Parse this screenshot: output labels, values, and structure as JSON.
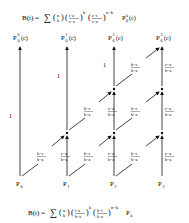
{
  "formulas": {
    "top": "B(t) = Σ ( n k ) ( (t−a)/(c−a) )^k ( (c−t)/(c−a) )^(n−k) P₀^k(c)",
    "bottom": "B(t) = Σ ( n k ) ( (t−a)/(b−a) )^k ( (b−t)/(b−a) )^(n−k) P_k"
  },
  "top_points": [
    {
      "base": "P",
      "sub": "0",
      "sup": "0",
      "arg": "(c)"
    },
    {
      "base": "P",
      "sub": "0",
      "sup": "1",
      "arg": "(c)"
    },
    {
      "base": "P",
      "sub": "0",
      "sup": "2",
      "arg": "(c)"
    },
    {
      "base": "P",
      "sub": "0",
      "sup": "3",
      "arg": "(c)"
    }
  ],
  "control_points": [
    {
      "base": "P",
      "sub": "0"
    },
    {
      "base": "P",
      "sub": "1"
    },
    {
      "base": "P",
      "sub": "2"
    },
    {
      "base": "P",
      "sub": "3"
    }
  ],
  "weights": {
    "one": "1",
    "vertical_num": "c−a",
    "vertical_den": "b−a",
    "diagonal_num": "b−c",
    "diagonal_den": "b−a"
  }
}
